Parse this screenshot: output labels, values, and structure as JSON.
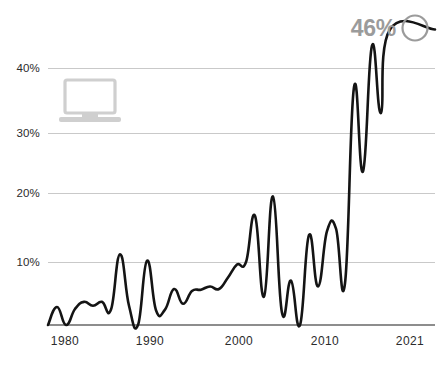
{
  "chart_data": {
    "type": "line",
    "title": "",
    "subtitle": "",
    "xlabel": "",
    "ylabel": "",
    "xlim": [
      1978,
      2021
    ],
    "ylim": [
      0,
      48
    ],
    "grid": true,
    "legend_position": "none",
    "x_tick_labels": [
      "1980",
      "1990",
      "2000",
      "2010",
      "2021"
    ],
    "x_ticks": [
      1980,
      1990,
      2000,
      2010,
      2021
    ],
    "y_tick_labels": [
      "10%",
      "20%",
      "30%",
      "40%"
    ],
    "y_ticks": [
      10,
      20,
      30,
      40
    ],
    "series": [
      {
        "name": "share",
        "color": "#141414",
        "x": [
          1978,
          1979,
          1980,
          1981,
          1982,
          1983,
          1984,
          1985,
          1986,
          1987,
          1988,
          1989,
          1990,
          1991,
          1992,
          1993,
          1994,
          1995,
          1996,
          1997,
          1998,
          1999,
          2000,
          2001,
          2002,
          2003,
          2004,
          2005,
          2006,
          2007,
          2008,
          2009,
          2010,
          2011,
          2012,
          2013,
          2014,
          2015,
          2016,
          2017,
          2018,
          2019,
          2020,
          2021
        ],
        "values": [
          0.0,
          2.8,
          0.0,
          2.5,
          3.6,
          3.0,
          3.6,
          2.4,
          11.0,
          3.0,
          0.0,
          10.0,
          2.3,
          2.4,
          5.6,
          3.3,
          5.3,
          5.5,
          6.0,
          5.6,
          7.4,
          9.4,
          9.8,
          17.0,
          4.4,
          20.0,
          1.9,
          6.9,
          0.0,
          14.0,
          6.0,
          14.6,
          15.0,
          6.5,
          37.0,
          23.9,
          43.5,
          33.0,
          46.0,
          46.0,
          46.0,
          46.0,
          46.0,
          46.0
        ]
      }
    ],
    "annotations": [
      {
        "name": "endpoint-callout",
        "label": "46%",
        "x": 2021,
        "y": 46,
        "marker": "circle-outline",
        "color": "#9b9b9b"
      }
    ],
    "decorations": [
      {
        "name": "laptop-icon",
        "icon": "laptop-icon",
        "color": "#cfcfcf"
      }
    ]
  },
  "axis": {
    "y_labels": [
      {
        "text": "40%",
        "value": 40
      },
      {
        "text": "30%",
        "value": 30
      },
      {
        "text": "20%",
        "value": 20
      },
      {
        "text": "10%",
        "value": 10
      }
    ],
    "x_labels": [
      {
        "text": "1980",
        "value": 1980
      },
      {
        "text": "1990",
        "value": 1990
      },
      {
        "text": "2000",
        "value": 2000
      },
      {
        "text": "2010",
        "value": 2010
      },
      {
        "text": "2021",
        "value": 2021
      }
    ]
  },
  "callout": {
    "value_label": "46%"
  },
  "colors": {
    "line": "#141414",
    "grid": "#c9c9c9",
    "baseline": "#8d8d8d",
    "callout": "#9b9b9b",
    "icon": "#cfcfcf",
    "background": "#ffffff",
    "tick_text": "#2b2b2b"
  }
}
